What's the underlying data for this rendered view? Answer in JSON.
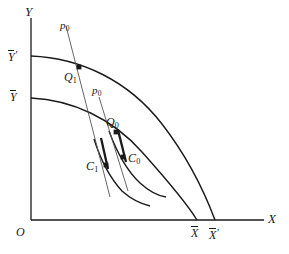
{
  "figure": {
    "type": "economics-diagram",
    "background_color": "#ffffff",
    "line_color": "#1a1a1a"
  },
  "axes": {
    "y_label": "Y",
    "x_label": "X",
    "origin_label": "O",
    "x_axis_y": 220,
    "y_axis_x": 31
  },
  "ticks": {
    "y": [
      {
        "id": "y-bar-prime",
        "base": "Y",
        "prime": "'",
        "overbar": true,
        "value_y": 56
      },
      {
        "id": "y-bar",
        "base": "Y",
        "prime": "",
        "overbar": true,
        "value_y": 98
      }
    ],
    "x": [
      {
        "id": "x-bar",
        "base": "X",
        "prime": "",
        "overbar": true,
        "value_x": 197
      },
      {
        "id": "x-bar-prime",
        "base": "X",
        "prime": "'",
        "overbar": true,
        "value_x": 215
      }
    ]
  },
  "curves": {
    "ppf_outer": {
      "name": "outer-production-possibility-frontier",
      "y_intercept": [
        31,
        56
      ],
      "x_intercept": [
        215,
        220
      ],
      "path": "M31,56 C 80,58 128,80 162,124 C 186,155 203,188 215,220"
    },
    "ppf_inner": {
      "name": "inner-production-possibility-frontier",
      "y_intercept": [
        31,
        98
      ],
      "x_intercept": [
        197,
        220
      ],
      "path": "M31,98 C 72,100 112,118 142,152 C 167,180 186,202 197,220"
    },
    "indifference_outer": {
      "name": "outer-indifference-curve",
      "path": "M109,131 C 116,150 126,170 140,183 C 150,192 158,196 166,197"
    },
    "indifference_inner": {
      "name": "inner-indifference-curve",
      "path": "M94,139 C 100,158 110,178 122,191 C 132,200 142,204 150,206"
    }
  },
  "price_lines": [
    {
      "id": "price-line-1",
      "label": "p",
      "subscript": "0",
      "label_pos": [
        60,
        20
      ],
      "from": [
        66,
        26
      ],
      "to": [
        110,
        197
      ]
    },
    {
      "id": "price-line-2",
      "label": "p",
      "subscript": "0",
      "label_pos": [
        92,
        85
      ],
      "from": [
        99,
        97
      ],
      "to": [
        128,
        191
      ]
    }
  ],
  "points": [
    {
      "id": "Q1",
      "label": "Q",
      "subscript": "1",
      "x": 79,
      "y": 67,
      "label_x": 64,
      "label_y": 71
    },
    {
      "id": "Q0",
      "label": "Q",
      "subscript": "0",
      "x": 116,
      "y": 132,
      "label_x": 106,
      "label_y": 116
    },
    {
      "id": "C0",
      "label": "C",
      "subscript": "0",
      "x": 123,
      "y": 157,
      "label_x": 128,
      "label_y": 152
    },
    {
      "id": "C1",
      "label": "C",
      "subscript": "1",
      "x": 106,
      "y": 165,
      "label_x": 86,
      "label_y": 160
    }
  ],
  "tangent_segments": [
    {
      "id": "tangent-at-C0",
      "from": [
        118,
        130
      ],
      "to": [
        126,
        162
      ]
    },
    {
      "id": "tangent-at-C1",
      "from": [
        101,
        138
      ],
      "to": [
        108,
        169
      ]
    }
  ]
}
